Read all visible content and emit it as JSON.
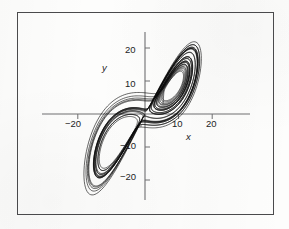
{
  "figure": {
    "kind": "phase-portrait",
    "border_color": "#4a4a4c",
    "curve_color": "#0c0c0c",
    "axis_color": "#6e6e70",
    "background_color": "#fdfdfc"
  },
  "axes": {
    "x_title": "x",
    "y_title": "y",
    "x_ticks": [
      {
        "label": "−20",
        "value": -20
      },
      {
        "label": "10",
        "value": 10
      },
      {
        "label": "20",
        "value": 20
      }
    ],
    "y_ticks": [
      {
        "label": "20",
        "value": 20
      },
      {
        "label": "10",
        "value": 10
      },
      {
        "label": "−10",
        "value": -10
      },
      {
        "label": "−20",
        "value": -20
      }
    ]
  },
  "chart_data": {
    "type": "line",
    "title": "",
    "subtitle": "",
    "xlabel": "x",
    "ylabel": "y",
    "xlim": [
      -30,
      30
    ],
    "ylim": [
      -27,
      27
    ],
    "grid": false,
    "legend": "none",
    "annotations": [],
    "series": [
      {
        "name": "trajectory",
        "kind": "lorenz-xy-projection",
        "sigma": 10,
        "rho": 28,
        "beta": 2.6666667,
        "x0": 0.9,
        "y0": 0.4,
        "z0": 18.0,
        "dt": 0.0048,
        "steps": 7400,
        "note": "x and y state variables plotted against one another; z not shown"
      }
    ]
  }
}
